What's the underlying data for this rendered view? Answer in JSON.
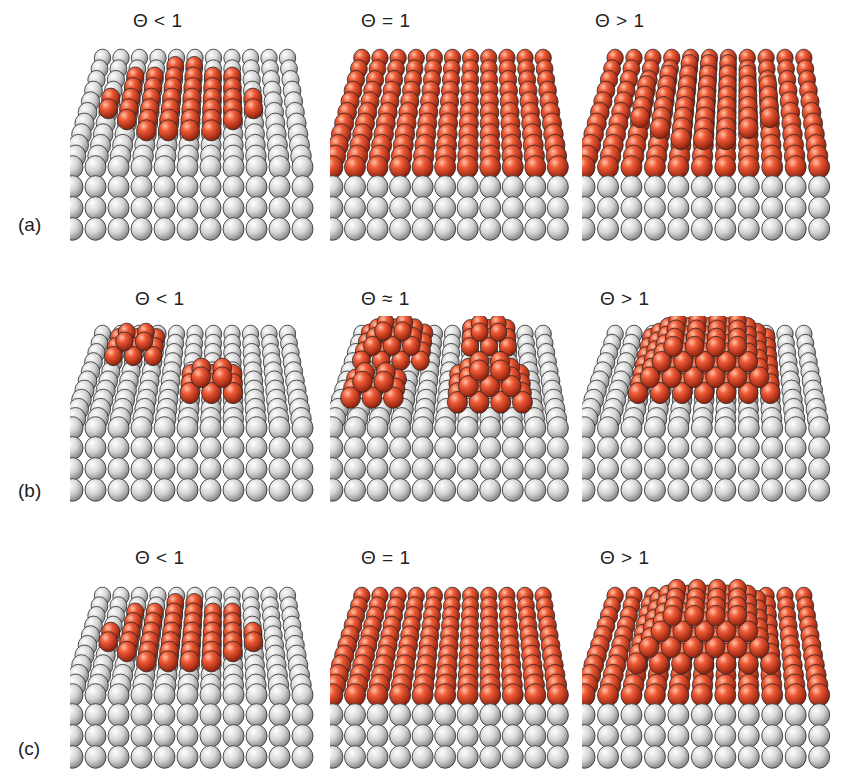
{
  "rows": [
    {
      "id": "a",
      "label": "(a)",
      "mode": "layer-by-layer",
      "panels": [
        {
          "coverage": "Θ < 1",
          "type": "partial-layer"
        },
        {
          "coverage": "Θ = 1",
          "type": "full-layer"
        },
        {
          "coverage": "Θ > 1",
          "type": "layer-plus-layer"
        }
      ]
    },
    {
      "id": "b",
      "label": "(b)",
      "mode": "island",
      "panels": [
        {
          "coverage": "Θ < 1",
          "type": "small-islands"
        },
        {
          "coverage": "Θ ≈ 1",
          "type": "multiple-islands"
        },
        {
          "coverage": "Θ > 1",
          "type": "large-island"
        }
      ]
    },
    {
      "id": "c",
      "label": "(c)",
      "mode": "layer-plus-island",
      "panels": [
        {
          "coverage": "Θ < 1",
          "type": "partial-layer"
        },
        {
          "coverage": "Θ = 1",
          "type": "full-layer"
        },
        {
          "coverage": "Θ > 1",
          "type": "layer-plus-island"
        }
      ]
    }
  ],
  "colors": {
    "substrate": "#d6d6d6",
    "adsorbate": "#d8482a",
    "outline": "#2a2a2a",
    "background": "#ffffff"
  }
}
